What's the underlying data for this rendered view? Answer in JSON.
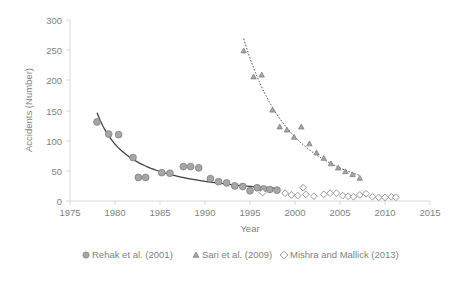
{
  "chart_data": {
    "type": "scatter",
    "title": "",
    "xlabel": "Year",
    "ylabel": "Accidents (Number)",
    "xlim": [
      1975,
      2015
    ],
    "ylim": [
      0,
      300
    ],
    "xticks": [
      1975,
      1980,
      1985,
      1990,
      1995,
      2000,
      2005,
      2010,
      2015
    ],
    "yticks": [
      0,
      50,
      100,
      150,
      200,
      250,
      300
    ],
    "grid": false,
    "legend_position": "bottom",
    "series": [
      {
        "name": "Rehak et al. (2001)",
        "marker": "circle",
        "color": "#a6a6a6",
        "edge_color": "#808080",
        "trendline": true,
        "points": [
          {
            "x": 1978.0,
            "y": 131
          },
          {
            "x": 1979.3,
            "y": 111
          },
          {
            "x": 1980.4,
            "y": 110
          },
          {
            "x": 1982.0,
            "y": 72
          },
          {
            "x": 1982.6,
            "y": 39
          },
          {
            "x": 1983.4,
            "y": 39
          },
          {
            "x": 1985.2,
            "y": 47
          },
          {
            "x": 1986.1,
            "y": 46
          },
          {
            "x": 1987.6,
            "y": 57
          },
          {
            "x": 1988.4,
            "y": 57
          },
          {
            "x": 1989.3,
            "y": 55
          },
          {
            "x": 1990.6,
            "y": 37
          },
          {
            "x": 1991.5,
            "y": 32
          },
          {
            "x": 1992.4,
            "y": 30
          },
          {
            "x": 1993.3,
            "y": 25
          },
          {
            "x": 1994.2,
            "y": 24
          },
          {
            "x": 1995.0,
            "y": 17
          },
          {
            "x": 1995.8,
            "y": 22
          },
          {
            "x": 1996.5,
            "y": 20
          },
          {
            "x": 1997.2,
            "y": 19
          },
          {
            "x": 1998.0,
            "y": 18
          }
        ]
      },
      {
        "name": "Sari et al. (2009)",
        "marker": "triangle",
        "color": "#a6a6a6",
        "edge_color": "#808080",
        "trendline": true,
        "points": [
          {
            "x": 1994.3,
            "y": 249
          },
          {
            "x": 1995.4,
            "y": 206
          },
          {
            "x": 1996.3,
            "y": 209
          },
          {
            "x": 1997.5,
            "y": 151
          },
          {
            "x": 1998.3,
            "y": 123
          },
          {
            "x": 1999.1,
            "y": 118
          },
          {
            "x": 1999.9,
            "y": 106
          },
          {
            "x": 2000.7,
            "y": 123
          },
          {
            "x": 2001.6,
            "y": 95
          },
          {
            "x": 2002.4,
            "y": 80
          },
          {
            "x": 2003.2,
            "y": 71
          },
          {
            "x": 2004.0,
            "y": 62
          },
          {
            "x": 2004.8,
            "y": 55
          },
          {
            "x": 2005.6,
            "y": 49
          },
          {
            "x": 2006.4,
            "y": 44
          },
          {
            "x": 2007.2,
            "y": 38
          }
        ]
      },
      {
        "name": "Mishra and Mallick (2013)",
        "marker": "diamond",
        "color": "#ffffff",
        "edge_color": "#808080",
        "trendline": false,
        "points": [
          {
            "x": 1996.4,
            "y": 14
          },
          {
            "x": 1998.9,
            "y": 13
          },
          {
            "x": 1999.6,
            "y": 10
          },
          {
            "x": 2000.3,
            "y": 9
          },
          {
            "x": 2000.9,
            "y": 22
          },
          {
            "x": 2001.2,
            "y": 11
          },
          {
            "x": 2002.1,
            "y": 8
          },
          {
            "x": 2003.2,
            "y": 11
          },
          {
            "x": 2003.9,
            "y": 13
          },
          {
            "x": 2004.6,
            "y": 13
          },
          {
            "x": 2005.3,
            "y": 9
          },
          {
            "x": 2005.9,
            "y": 8
          },
          {
            "x": 2006.5,
            "y": 7
          },
          {
            "x": 2007.2,
            "y": 10
          },
          {
            "x": 2007.9,
            "y": 12
          },
          {
            "x": 2008.6,
            "y": 7
          },
          {
            "x": 2009.3,
            "y": 6
          },
          {
            "x": 2010.0,
            "y": 6
          },
          {
            "x": 2010.7,
            "y": 7
          },
          {
            "x": 2011.2,
            "y": 6
          }
        ]
      }
    ]
  },
  "axes": {
    "y_title": "Accidents (Number)",
    "x_title": "Year",
    "y_tick_labels": [
      "300",
      "250",
      "200",
      "150",
      "100",
      "50",
      "0"
    ],
    "x_tick_labels": [
      "1975",
      "1980",
      "1985",
      "1990",
      "1995",
      "2000",
      "2005",
      "2010",
      "2015"
    ]
  },
  "legend": {
    "items": [
      {
        "label": "Rehak et al. (2001)",
        "marker": "circle-marker"
      },
      {
        "label": "Sari et al. (2009)",
        "marker": "triangle-marker"
      },
      {
        "label": "Mishra and Mallick (2013)",
        "marker": "diamond-marker"
      }
    ]
  },
  "colors": {
    "marker_fill": "#a6a6a6",
    "marker_edge": "#808080",
    "open_marker_fill": "#ffffff",
    "axis": "#d9d9d9",
    "text": "#7f7f7f",
    "trend": "#404040"
  }
}
